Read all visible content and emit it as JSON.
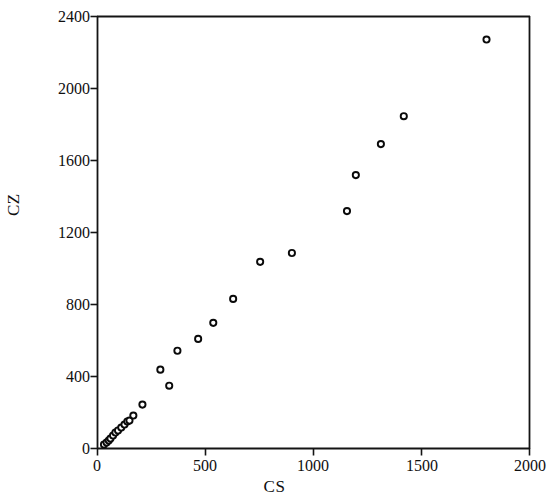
{
  "chart_data": {
    "type": "scatter",
    "title": "",
    "subtitle": "",
    "xlabel": "CS",
    "ylabel": "CZ",
    "xlim": [
      0,
      2000
    ],
    "ylim": [
      0,
      2400
    ],
    "xticks": [
      0,
      500,
      1000,
      1500,
      2000
    ],
    "yticks": [
      0,
      400,
      800,
      1200,
      1600,
      2000,
      2400
    ],
    "xtick_labels": [
      "0",
      "500",
      "1000",
      "1500",
      "2000"
    ],
    "ytick_labels": [
      "0",
      "400",
      "800",
      "1200",
      "1600",
      "2000",
      "2400"
    ],
    "grid": false,
    "legend": null,
    "marker": "open-circle",
    "marker_color": "#0a0a0a",
    "marker_fill": "#ffffff",
    "series": [
      {
        "name": "CS vs CZ",
        "points": [
          [
            30,
            22
          ],
          [
            42,
            33
          ],
          [
            52,
            44
          ],
          [
            60,
            55
          ],
          [
            72,
            72
          ],
          [
            83,
            89
          ],
          [
            95,
            100
          ],
          [
            110,
            116
          ],
          [
            125,
            133
          ],
          [
            138,
            150
          ],
          [
            148,
            155
          ],
          [
            166,
            183
          ],
          [
            208,
            244
          ],
          [
            291,
            438
          ],
          [
            332,
            349
          ],
          [
            370,
            543
          ],
          [
            466,
            609
          ],
          [
            536,
            698
          ],
          [
            628,
            831
          ],
          [
            753,
            1037
          ],
          [
            900,
            1086
          ],
          [
            1155,
            1319
          ],
          [
            1196,
            1519
          ],
          [
            1312,
            1691
          ],
          [
            1418,
            1846
          ],
          [
            1801,
            2272
          ]
        ]
      }
    ]
  },
  "axes": {
    "x_title": "CS",
    "y_title": "CZ"
  }
}
